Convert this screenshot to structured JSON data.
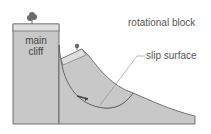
{
  "diagram": {
    "labels": {
      "main_cliff_line1": "main",
      "main_cliff_line2": "cliff",
      "rotational_block": "rotational block",
      "slip_surface": "slip surface"
    },
    "colors": {
      "rock": "#c8c8c8",
      "rock_top_strip": "#dedede",
      "outline": "#555555",
      "tree": "#6a6a6a",
      "leader_line": "#888888",
      "text": "#555555"
    }
  }
}
